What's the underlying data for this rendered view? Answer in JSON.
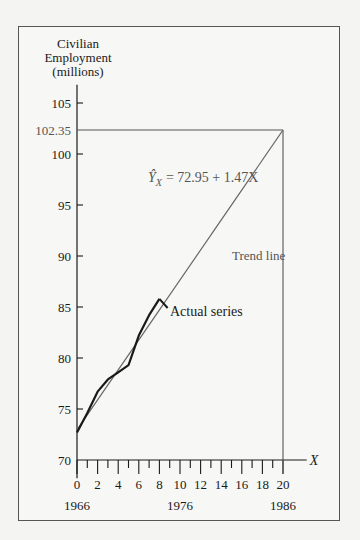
{
  "chart_data": {
    "type": "line",
    "title": "",
    "ylabel": "Civilian Employment (millions)",
    "xlabel": "X",
    "ylim": [
      70,
      105
    ],
    "xlim": [
      0,
      20
    ],
    "grid": false,
    "y_ticks": [
      70,
      75,
      80,
      85,
      90,
      95,
      100,
      105
    ],
    "x_ticks": [
      0,
      2,
      4,
      6,
      8,
      10,
      12,
      14,
      16,
      18,
      20
    ],
    "x_year_labels": [
      {
        "x": 0,
        "label": "1966"
      },
      {
        "x": 10,
        "label": "1976"
      },
      {
        "x": 20,
        "label": "1986"
      }
    ],
    "projection_value": "102.35",
    "equation": "= 72.95 + 1.47X",
    "equation_lhs": "Ŷ",
    "equation_sub": "X",
    "series": [
      {
        "name": "Actual series",
        "x": [
          0,
          1,
          2,
          3,
          4,
          5,
          6,
          7,
          8
        ],
        "values": [
          72.7,
          74.6,
          76.7,
          77.9,
          78.6,
          79.3,
          82.2,
          84.2,
          85.8
        ]
      },
      {
        "name": "Trend line",
        "x": [
          0,
          20
        ],
        "values": [
          72.95,
          102.35
        ],
        "intercept": 72.95,
        "slope": 1.47
      }
    ],
    "annotations": [
      "Trend line",
      "Actual series",
      "Ŷ_X = 72.95 + 1.47X",
      "102.35"
    ]
  },
  "labels": {
    "ylabel_lines": [
      "Civilian",
      "Employment",
      "(millions)"
    ],
    "x_axis_name": "X",
    "trend_label": "Trend line",
    "actual_label": "Actual series"
  }
}
